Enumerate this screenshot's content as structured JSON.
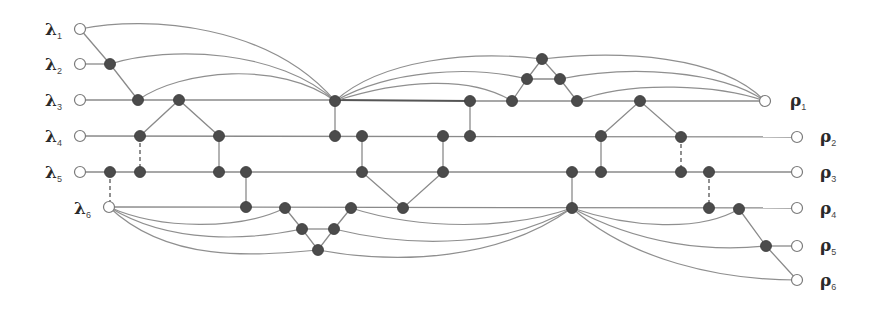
{
  "diagram": {
    "type": "network graph",
    "left_terminals": [
      {
        "symbol": "λ",
        "sub": "1",
        "x": 80,
        "y": 29
      },
      {
        "symbol": "λ",
        "sub": "2",
        "x": 80,
        "y": 64
      },
      {
        "symbol": "λ",
        "sub": "3",
        "x": 80,
        "y": 100
      },
      {
        "symbol": "λ",
        "sub": "4",
        "x": 80,
        "y": 136
      },
      {
        "symbol": "λ",
        "sub": "5",
        "x": 80,
        "y": 172
      },
      {
        "symbol": "λ",
        "sub": "6",
        "x": 109,
        "y": 207
      }
    ],
    "right_terminals": [
      {
        "symbol": "ρ",
        "sub": "1",
        "x": 765,
        "y": 101
      },
      {
        "symbol": "ρ",
        "sub": "2",
        "x": 797,
        "y": 137
      },
      {
        "symbol": "ρ",
        "sub": "3",
        "x": 797,
        "y": 172
      },
      {
        "symbol": "ρ",
        "sub": "4",
        "x": 797,
        "y": 208
      },
      {
        "symbol": "ρ",
        "sub": "5",
        "x": 797,
        "y": 246
      },
      {
        "symbol": "ρ",
        "sub": "6",
        "x": 797,
        "y": 280
      }
    ],
    "colors": {
      "node_fill": "#4b4b4b",
      "edge": "#8a8a8a",
      "terminal_fill": "#ffffff"
    }
  }
}
